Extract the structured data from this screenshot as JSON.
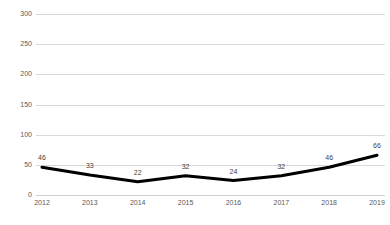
{
  "chart_data": {
    "type": "line",
    "title": "",
    "subtitle": "",
    "xlabel": "",
    "ylabel": "",
    "categories": [
      "2012",
      "2013",
      "2014",
      "2015",
      "2016",
      "2017",
      "2018",
      "2019"
    ],
    "values": [
      46,
      33,
      22,
      32,
      24,
      32,
      46,
      66
    ],
    "series": [
      {
        "name": "",
        "values": [
          46,
          33,
          22,
          32,
          24,
          32,
          46,
          66
        ]
      }
    ],
    "data_labels": [
      "46",
      "33",
      "22",
      "32",
      "24",
      "32",
      "46",
      "66"
    ],
    "ylim": [
      0,
      300
    ],
    "yticks": [
      0,
      50,
      100,
      150,
      200,
      250,
      300
    ],
    "ytick_labels": [
      "0",
      "50",
      "100",
      "150",
      "200",
      "250",
      "300"
    ],
    "xtick_labels": [
      "2012",
      "2013",
      "2014",
      "2015",
      "2016",
      "2017",
      "2018",
      "2019"
    ],
    "grid": true,
    "grid_axis": "y",
    "legend": false,
    "legend_position": "none",
    "line_color": "#000000",
    "line_width": 3,
    "grid_color": "#d9d9d9",
    "label_color": "#3f3f3f",
    "tick_color": "#595959",
    "background": "#ffffff",
    "markers": false
  }
}
